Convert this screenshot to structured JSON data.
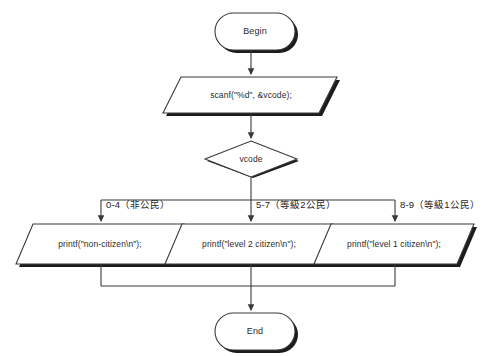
{
  "diagram": {
    "type": "flowchart",
    "nodes": {
      "begin": {
        "label": "Begin",
        "shape": "terminator"
      },
      "input": {
        "label": "scanf(\"%d\", &vcode);",
        "shape": "parallelogram"
      },
      "decision": {
        "label": "vcode",
        "shape": "diamond"
      },
      "out_left": {
        "label": "printf(\"non-citizen\\n\");",
        "shape": "parallelogram"
      },
      "out_mid": {
        "label": "printf(\"level 2 citizen\\n\");",
        "shape": "parallelogram"
      },
      "out_right": {
        "label": "printf(\"level 1 citizen\\n\");",
        "shape": "parallelogram"
      },
      "end": {
        "label": "End",
        "shape": "terminator"
      }
    },
    "branches": [
      {
        "label": "0-4（非公民）",
        "target": "out_left"
      },
      {
        "label": "5-7（等級2公民）",
        "target": "out_mid"
      },
      {
        "label": "8-9（等級1公民）",
        "target": "out_right"
      }
    ],
    "colors": {
      "stroke": "#3a3a3a",
      "shadow": "#1a1a1a",
      "fill": "#ffffff",
      "text": "#2b2b2b",
      "background": "#ffffff"
    }
  }
}
